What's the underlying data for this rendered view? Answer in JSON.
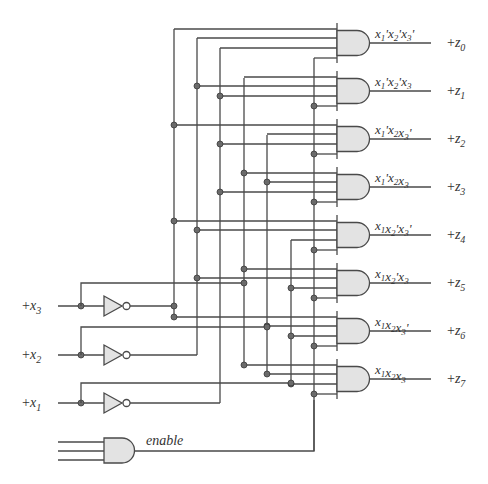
{
  "colors": {
    "wire": "#4a4a4a",
    "gate_fill": "#e3e3e3",
    "dot": "#6a6a6a",
    "text": "#333333"
  },
  "inputs": [
    {
      "name": "x3",
      "label_prefix": "+",
      "label_var": "x",
      "label_sub": "3",
      "y": 306,
      "true_branch_y": 283,
      "true_bus_x": 244,
      "inverted_bus_x": 174
    },
    {
      "name": "x2",
      "label_prefix": "+",
      "label_var": "x",
      "label_sub": "2",
      "y": 355,
      "true_branch_y": 327,
      "true_bus_x": 267,
      "inverted_bus_x": 197
    },
    {
      "name": "x1",
      "label_prefix": "+",
      "label_var": "x",
      "label_sub": "1",
      "y": 403,
      "true_branch_y": 383,
      "true_bus_x": 291,
      "inverted_bus_x": 220
    }
  ],
  "enable_gate": {
    "label": "enable",
    "input_ys": [
      442,
      451,
      460
    ],
    "output_y": 451,
    "bus_x": 314
  },
  "buses": [
    {
      "signal": "x3'",
      "x": 174,
      "y_top": 29,
      "y_bottom": 318
    },
    {
      "signal": "x2'",
      "x": 197,
      "y_top": 38,
      "y_bottom": 355
    },
    {
      "signal": "x1'",
      "x": 220,
      "y_top": 48,
      "y_bottom": 403
    },
    {
      "signal": "x3",
      "x": 244,
      "y_top": 78,
      "y_bottom": 364
    },
    {
      "signal": "x2",
      "x": 267,
      "y_top": 135,
      "y_bottom": 374
    },
    {
      "signal": "x1",
      "x": 291,
      "y_top": 240,
      "y_bottom": 384
    },
    {
      "signal": "enable",
      "x": 314,
      "y_top": 58,
      "y_bottom": 451
    }
  ],
  "gates": [
    {
      "term": "x1'x2'x3'",
      "parts": [
        [
          "x",
          "1",
          "'"
        ],
        [
          "x",
          "2",
          "'"
        ],
        [
          "x",
          "3",
          "'"
        ]
      ],
      "output": "z",
      "output_sub": "0",
      "inputs": [
        "x3'",
        "x2'",
        "x1'",
        "enable"
      ]
    },
    {
      "term": "x1'x2'x3",
      "parts": [
        [
          "x",
          "1",
          "'"
        ],
        [
          "x",
          "2",
          "'"
        ],
        [
          "x",
          "3",
          ""
        ]
      ],
      "output": "z",
      "output_sub": "1",
      "inputs": [
        "x3",
        "x2'",
        "x1'",
        "enable"
      ]
    },
    {
      "term": "x1'x2x3'",
      "parts": [
        [
          "x",
          "1",
          "'"
        ],
        [
          "x",
          "2",
          ""
        ],
        [
          "x",
          "3",
          "'"
        ]
      ],
      "output": "z",
      "output_sub": "2",
      "inputs": [
        "x3'",
        "x2",
        "x1'",
        "enable"
      ]
    },
    {
      "term": "x1'x2x3",
      "parts": [
        [
          "x",
          "1",
          "'"
        ],
        [
          "x",
          "2",
          ""
        ],
        [
          "x",
          "3",
          ""
        ]
      ],
      "output": "z",
      "output_sub": "3",
      "inputs": [
        "x3",
        "x2",
        "x1'",
        "enable"
      ]
    },
    {
      "term": "x1x2'x3'",
      "parts": [
        [
          "x",
          "1",
          ""
        ],
        [
          "x",
          "2",
          "'"
        ],
        [
          "x",
          "3",
          "'"
        ]
      ],
      "output": "z",
      "output_sub": "4",
      "inputs": [
        "x3'",
        "x2'",
        "x1",
        "enable"
      ]
    },
    {
      "term": "x1x2'x3",
      "parts": [
        [
          "x",
          "1",
          ""
        ],
        [
          "x",
          "2",
          "'"
        ],
        [
          "x",
          "3",
          ""
        ]
      ],
      "output": "z",
      "output_sub": "5",
      "inputs": [
        "x3",
        "x2'",
        "x1",
        "enable"
      ]
    },
    {
      "term": "x1x2x3'",
      "parts": [
        [
          "x",
          "1",
          ""
        ],
        [
          "x",
          "2",
          ""
        ],
        [
          "x",
          "3",
          "'"
        ]
      ],
      "output": "z",
      "output_sub": "6",
      "inputs": [
        "x3'",
        "x2",
        "x1",
        "enable"
      ]
    },
    {
      "term": "x1x2x3",
      "parts": [
        [
          "x",
          "1",
          ""
        ],
        [
          "x",
          "2",
          ""
        ],
        [
          "x",
          "3",
          ""
        ]
      ],
      "output": "z",
      "output_sub": "7",
      "inputs": [
        "x3",
        "x2",
        "x1",
        "enable"
      ]
    }
  ],
  "layout": {
    "gate_left_x": 337,
    "gate_first_center_y": 43,
    "gate_pitch": 48,
    "output_end_x": 431,
    "output_label_x": 447,
    "term_label_x": 375
  }
}
